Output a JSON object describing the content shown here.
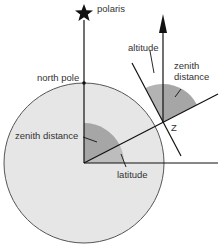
{
  "diagram": {
    "labels": {
      "polaris": "polaris",
      "north_pole": "north pole",
      "altitude": "altitude",
      "zenith_distance_top_line1": "zenith",
      "zenith_distance_top_line2": "distance",
      "zenith_distance_center": "zenith distance",
      "latitude": "latitude",
      "z_point": "Z"
    },
    "icons": {
      "star": "star-icon",
      "arrowhead": "arrow-up-icon"
    },
    "colors": {
      "earth_fill": "#e6e6e6",
      "earth_stroke": "#555555",
      "wedge_dark": "#a6a6a6",
      "wedge_light": "#bdbdbd",
      "line": "#111111",
      "text": "#333333"
    }
  }
}
